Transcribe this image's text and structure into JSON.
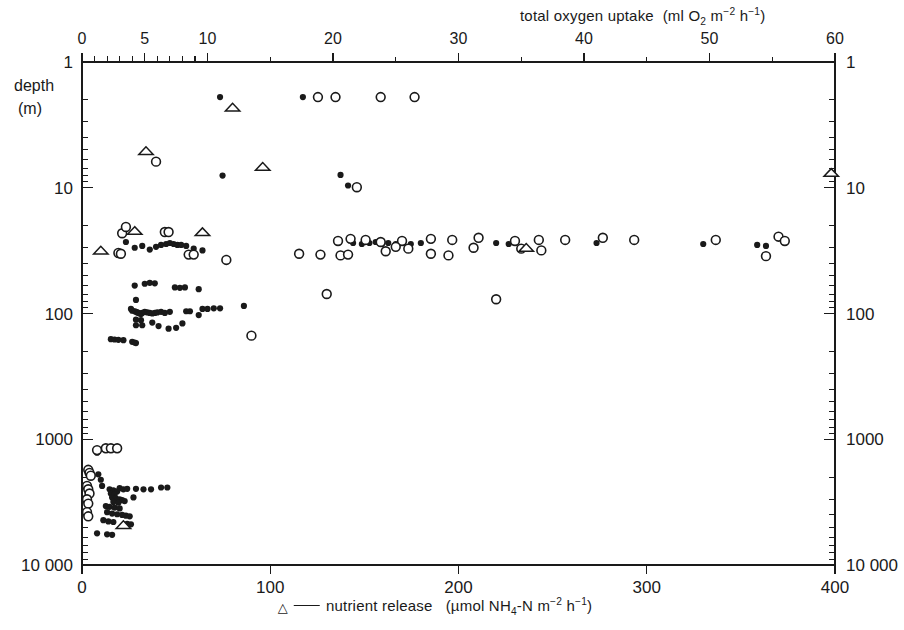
{
  "figure": {
    "title_top": "total oxygen uptake",
    "units_top": "(ml O2 m-2 h-1)",
    "caption_bottom": "nutrient release",
    "units_bottom": "(umol NH4-N m-2 h-1)",
    "y_title_line1": "depth",
    "y_title_line2": "(m)"
  },
  "chart_data": {
    "type": "scatter",
    "subtitle": "",
    "xlabel": "total oxygen uptake (ml O2 m-2 h-1)",
    "xlabel_bottom": "nutrient release (umol NH4-N m-2 h-1)",
    "ylabel": "depth (m)",
    "yscale": "log",
    "ylim": [
      1,
      10000
    ],
    "y_inverted": true,
    "grid": false,
    "legend_position": "bottom",
    "axes": {
      "top": {
        "name": "total oxygen uptake",
        "units": "ml O2 m-2 h-1",
        "min": 0,
        "max": 60,
        "ticks": [
          0,
          5,
          10,
          20,
          30,
          40,
          50,
          60
        ],
        "tick_labels": [
          "0",
          "5",
          "10",
          "20",
          "30",
          "40",
          "50",
          "60"
        ],
        "minor_ticks": [
          1,
          2,
          3,
          4,
          6,
          7,
          8,
          9
        ]
      },
      "bottom": {
        "name": "nutrient release",
        "units": "umol NH4-N m-2 h-1",
        "min": 0,
        "max": 400,
        "ticks": [
          0,
          100,
          200,
          300,
          400
        ],
        "tick_labels": [
          "0",
          "100",
          "200",
          "300",
          "400"
        ]
      },
      "left": {
        "name": "depth",
        "units": "m",
        "scale": "log",
        "min": 1,
        "max": 10000,
        "ticks": [
          1,
          10,
          100,
          1000,
          10000
        ],
        "tick_labels": [
          "1",
          "10",
          "100",
          "1000",
          "10 000"
        ]
      },
      "right": {
        "name": "depth",
        "units": "m",
        "scale": "log",
        "min": 1,
        "max": 10000,
        "ticks": [
          1,
          10,
          100,
          1000,
          10000
        ],
        "tick_labels": [
          "1",
          "10",
          "100",
          "1000",
          "10 000"
        ]
      }
    },
    "legend": [
      {
        "marker": "filled-circle",
        "label": "total oxygen uptake (filled circle)",
        "axis": "top"
      },
      {
        "marker": "open-circle",
        "label": "total oxygen uptake (open circle)",
        "axis": "top"
      },
      {
        "marker": "open-triangle",
        "label": "nutrient release",
        "axis": "bottom"
      }
    ],
    "series": [
      {
        "name": "oxygen uptake - filled circles",
        "marker": "filled-circle",
        "x_axis": "top",
        "points": [
          [
            11.0,
            1.9
          ],
          [
            17.6,
            1.9
          ],
          [
            11.2,
            8.0
          ],
          [
            20.6,
            7.9
          ],
          [
            21.2,
            9.6
          ],
          [
            3.5,
            27.0
          ],
          [
            4.2,
            30.0
          ],
          [
            4.8,
            29.0
          ],
          [
            5.4,
            31.0
          ],
          [
            5.9,
            29.5
          ],
          [
            6.3,
            28.5
          ],
          [
            6.7,
            28.0
          ],
          [
            7.0,
            27.5
          ],
          [
            7.3,
            28.0
          ],
          [
            7.6,
            28.5
          ],
          [
            7.9,
            28.5
          ],
          [
            8.3,
            29.0
          ],
          [
            8.9,
            30.5
          ],
          [
            9.6,
            31.5
          ],
          [
            21.6,
            27.5
          ],
          [
            22.3,
            28.0
          ],
          [
            22.9,
            27.5
          ],
          [
            23.4,
            27.0
          ],
          [
            23.9,
            28.0
          ],
          [
            24.4,
            27.5
          ],
          [
            25.0,
            28.0
          ],
          [
            25.6,
            27.5
          ],
          [
            26.2,
            28.0
          ],
          [
            27.0,
            27.5
          ],
          [
            33.0,
            27.5
          ],
          [
            34.0,
            28.0
          ],
          [
            41.0,
            27.5
          ],
          [
            49.5,
            28.0
          ],
          [
            53.8,
            28.5
          ],
          [
            54.5,
            29.0
          ],
          [
            4.2,
            60.0
          ],
          [
            5.0,
            58.0
          ],
          [
            5.4,
            57.0
          ],
          [
            5.8,
            57.5
          ],
          [
            7.4,
            62.0
          ],
          [
            7.8,
            62.5
          ],
          [
            8.2,
            62.0
          ],
          [
            9.3,
            64.0
          ],
          [
            4.3,
            78.0
          ],
          [
            3.9,
            92.0
          ],
          [
            4.0,
            95.0
          ],
          [
            4.2,
            96.0
          ],
          [
            4.3,
            97.0
          ],
          [
            4.4,
            98.0
          ],
          [
            4.5,
            99.0
          ],
          [
            4.6,
            100.0
          ],
          [
            4.7,
            101.0
          ],
          [
            4.8,
            99.0
          ],
          [
            5.0,
            97.0
          ],
          [
            5.2,
            98.0
          ],
          [
            5.4,
            99.0
          ],
          [
            5.6,
            100.0
          ],
          [
            5.8,
            99.0
          ],
          [
            6.0,
            98.0
          ],
          [
            6.3,
            97.0
          ],
          [
            6.6,
            99.0
          ],
          [
            7.0,
            97.0
          ],
          [
            4.3,
            112.0
          ],
          [
            4.7,
            113.0
          ],
          [
            4.3,
            124.0
          ],
          [
            4.8,
            124.0
          ],
          [
            5.6,
            118.0
          ],
          [
            6.1,
            126.0
          ],
          [
            6.9,
            132.0
          ],
          [
            7.5,
            130.0
          ],
          [
            8.0,
            120.0
          ],
          [
            8.3,
            96.0
          ],
          [
            8.6,
            96.0
          ],
          [
            9.6,
            92.0
          ],
          [
            10.0,
            92.0
          ],
          [
            10.5,
            91.0
          ],
          [
            11.0,
            91.0
          ],
          [
            9.3,
            103.0
          ],
          [
            12.9,
            87.0
          ],
          [
            2.3,
            160.0
          ],
          [
            2.6,
            161.0
          ],
          [
            2.9,
            162.0
          ],
          [
            3.3,
            163.0
          ],
          [
            4.0,
            168.0
          ],
          [
            4.2,
            170.0
          ],
          [
            4.3,
            172.0
          ],
          [
            1.2,
            1280.0
          ],
          [
            1.3,
            1900.0
          ],
          [
            1.5,
            2100.0
          ],
          [
            1.6,
            2350.0
          ],
          [
            2.2,
            2500.0
          ],
          [
            2.5,
            2550.0
          ],
          [
            2.8,
            2600.0
          ],
          [
            2.3,
            2700.0
          ],
          [
            2.6,
            2750.0
          ],
          [
            3.0,
            2450.0
          ],
          [
            3.3,
            2500.0
          ],
          [
            3.6,
            2480.0
          ],
          [
            2.4,
            2900.0
          ],
          [
            2.7,
            2950.0
          ],
          [
            3.0,
            3000.0
          ],
          [
            3.2,
            3050.0
          ],
          [
            2.5,
            3150.0
          ],
          [
            2.9,
            3200.0
          ],
          [
            3.4,
            3100.0
          ],
          [
            4.3,
            2480.0
          ],
          [
            4.9,
            2500.0
          ],
          [
            5.5,
            2500.0
          ],
          [
            6.3,
            2420.0
          ],
          [
            6.8,
            2420.0
          ],
          [
            4.1,
            2900.0
          ],
          [
            1.9,
            3400.0
          ],
          [
            2.2,
            3450.0
          ],
          [
            2.6,
            3500.0
          ],
          [
            3.0,
            3550.0
          ],
          [
            2.0,
            3800.0
          ],
          [
            2.4,
            3900.0
          ],
          [
            2.8,
            3950.0
          ],
          [
            3.2,
            4000.0
          ],
          [
            3.5,
            4050.0
          ],
          [
            3.8,
            4100.0
          ],
          [
            1.7,
            4400.0
          ],
          [
            2.1,
            4500.0
          ],
          [
            2.5,
            4550.0
          ],
          [
            3.6,
            4700.0
          ],
          [
            3.9,
            4750.0
          ],
          [
            1.2,
            5600.0
          ],
          [
            2.0,
            5700.0
          ],
          [
            2.4,
            5750.0
          ]
        ]
      },
      {
        "name": "oxygen uptake - open circles",
        "marker": "open-circle",
        "x_axis": "top",
        "points": [
          [
            18.8,
            1.9
          ],
          [
            20.2,
            1.9
          ],
          [
            23.8,
            1.9
          ],
          [
            26.5,
            1.9
          ],
          [
            5.9,
            6.2
          ],
          [
            21.9,
            9.9
          ],
          [
            3.2,
            23.0
          ],
          [
            3.5,
            20.5
          ],
          [
            6.6,
            22.5
          ],
          [
            6.9,
            22.5
          ],
          [
            2.9,
            33.0
          ],
          [
            3.1,
            33.5
          ],
          [
            8.5,
            34.0
          ],
          [
            8.9,
            34.0
          ],
          [
            11.5,
            37.5
          ],
          [
            17.3,
            33.5
          ],
          [
            19.0,
            34.0
          ],
          [
            20.6,
            34.5
          ],
          [
            21.2,
            34.0
          ],
          [
            27.8,
            33.5
          ],
          [
            29.2,
            34.5
          ],
          [
            20.4,
            26.5
          ],
          [
            21.4,
            25.5
          ],
          [
            22.6,
            26.0
          ],
          [
            23.8,
            27.0
          ],
          [
            25.5,
            26.5
          ],
          [
            27.8,
            25.5
          ],
          [
            29.5,
            26.0
          ],
          [
            31.6,
            25.0
          ],
          [
            34.5,
            26.5
          ],
          [
            36.4,
            26.0
          ],
          [
            38.5,
            26.0
          ],
          [
            41.5,
            25.0
          ],
          [
            44.0,
            26.0
          ],
          [
            50.5,
            26.0
          ],
          [
            55.5,
            24.5
          ],
          [
            56.0,
            26.5
          ],
          [
            31.2,
            30.0
          ],
          [
            35.0,
            30.5
          ],
          [
            36.6,
            31.5
          ],
          [
            54.5,
            35.0
          ],
          [
            25.0,
            29.5
          ],
          [
            26.0,
            30.5
          ],
          [
            24.2,
            32.0
          ],
          [
            19.5,
            70.0
          ],
          [
            33.0,
            77.0
          ],
          [
            13.5,
            150.0
          ],
          [
            1.2,
            1220.0
          ],
          [
            1.9,
            1180.0
          ],
          [
            2.3,
            1180.0
          ],
          [
            2.8,
            1180.0
          ],
          [
            0.5,
            1750.0
          ],
          [
            0.6,
            1850.0
          ],
          [
            0.7,
            1950.0
          ],
          [
            0.4,
            2350.0
          ],
          [
            0.5,
            2500.0
          ],
          [
            0.6,
            2700.0
          ],
          [
            0.4,
            3000.0
          ],
          [
            0.5,
            3250.0
          ],
          [
            0.4,
            3800.0
          ],
          [
            0.5,
            4100.0
          ]
        ]
      },
      {
        "name": "nutrient release - open triangles",
        "marker": "open-triangle",
        "x_axis": "bottom",
        "points": [
          [
            80.0,
            2.3
          ],
          [
            34.0,
            5.1
          ],
          [
            96.0,
            6.8
          ],
          [
            28.0,
            22.0
          ],
          [
            10.0,
            31.5
          ],
          [
            64.0,
            22.5
          ],
          [
            236.0,
            30.0
          ],
          [
            398.0,
            7.6
          ],
          [
            22.0,
            4800.0
          ]
        ]
      }
    ]
  }
}
